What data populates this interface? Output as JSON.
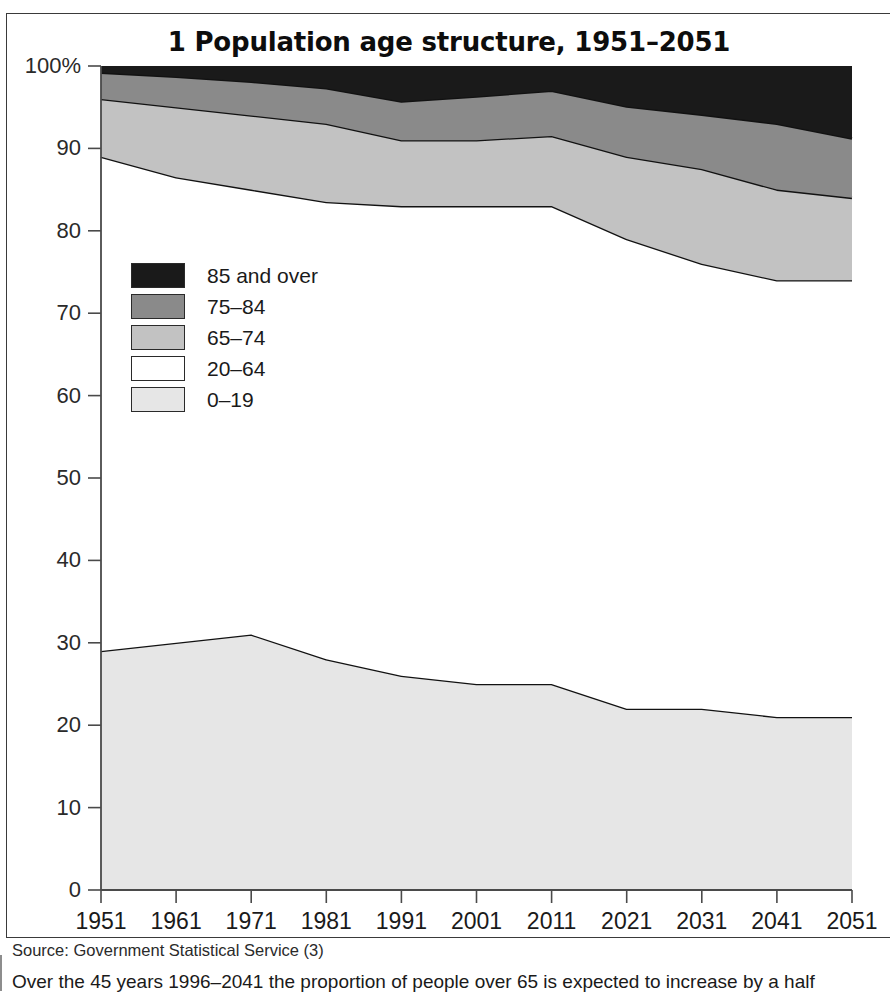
{
  "figure": {
    "title": "1 Population age structure, 1951–2051",
    "source": "Source: Government Statistical Service (3)",
    "caption": "Over the 45 years 1996–2041 the proportion of people over 65 is expected to increase by a half"
  },
  "legend": {
    "position": "inside-upper-left",
    "items": [
      {
        "label": "85 and over",
        "color": "#1a1a1a"
      },
      {
        "label": "75–84",
        "color": "#8a8a8a"
      },
      {
        "label": "65–74",
        "color": "#c2c2c2"
      },
      {
        "label": "20–64",
        "color": "#ffffff"
      },
      {
        "label": "0–19",
        "color": "#e6e6e6"
      }
    ]
  },
  "axes": {
    "y_ticks": [
      "0",
      "10",
      "20",
      "30",
      "40",
      "50",
      "60",
      "70",
      "80",
      "90",
      "100%"
    ],
    "y_tick_values": [
      0,
      10,
      20,
      30,
      40,
      50,
      60,
      70,
      80,
      90,
      100
    ],
    "x_ticks": [
      "1951",
      "1961",
      "1971",
      "1981",
      "1991",
      "2001",
      "2011",
      "2021",
      "2031",
      "2041",
      "2051"
    ]
  },
  "chart_data": {
    "type": "area",
    "stacked": true,
    "title": "1 Population age structure, 1951–2051",
    "xlabel": "",
    "ylabel": "",
    "ylim": [
      0,
      100
    ],
    "grid": false,
    "legend_position": "inside-upper-left",
    "x": [
      1951,
      1961,
      1971,
      1981,
      1991,
      2001,
      2011,
      2021,
      2031,
      2041,
      2051
    ],
    "series": [
      {
        "name": "0–19",
        "color": "#e6e6e6",
        "values": [
          29.0,
          30.0,
          31.0,
          28.0,
          26.0,
          25.0,
          25.0,
          22.0,
          22.0,
          21.0,
          21.0
        ]
      },
      {
        "name": "20–64",
        "color": "#ffffff",
        "values": [
          60.0,
          56.5,
          54.0,
          55.5,
          57.0,
          58.0,
          58.0,
          57.0,
          54.0,
          53.0,
          53.0
        ]
      },
      {
        "name": "65–74",
        "color": "#c2c2c2",
        "values": [
          7.0,
          8.5,
          9.0,
          9.5,
          8.0,
          8.0,
          8.5,
          10.0,
          11.5,
          11.0,
          10.0
        ]
      },
      {
        "name": "75–84",
        "color": "#8a8a8a",
        "values": [
          3.2,
          3.7,
          4.1,
          4.3,
          4.7,
          5.3,
          5.5,
          6.1,
          6.6,
          8.0,
          7.2
        ]
      },
      {
        "name": "85 and over",
        "color": "#1a1a1a",
        "values": [
          0.8,
          1.3,
          1.9,
          2.7,
          4.3,
          3.7,
          3.0,
          4.9,
          5.9,
          7.0,
          8.8
        ]
      }
    ],
    "cumulative_boundaries": {
      "top_of_0_19": [
        29.0,
        30.0,
        31.0,
        28.0,
        26.0,
        25.0,
        25.0,
        22.0,
        22.0,
        21.0,
        21.0
      ],
      "top_of_20_64": [
        89.0,
        86.5,
        85.0,
        83.5,
        83.0,
        83.0,
        83.0,
        79.0,
        76.0,
        74.0,
        74.0
      ],
      "top_of_65_74": [
        96.0,
        95.0,
        94.0,
        93.0,
        91.0,
        91.0,
        91.5,
        89.0,
        87.5,
        85.0,
        84.0
      ],
      "top_of_75_84": [
        99.2,
        98.7,
        98.1,
        97.3,
        95.7,
        96.3,
        97.0,
        95.1,
        94.1,
        93.0,
        91.2
      ],
      "top_of_85_plus": [
        100,
        100,
        100,
        100,
        100,
        100,
        100,
        100,
        100,
        100,
        100
      ]
    }
  },
  "geometry": {
    "plot_left": 94,
    "plot_right": 845,
    "plot_top": 52,
    "plot_bottom": 876
  }
}
